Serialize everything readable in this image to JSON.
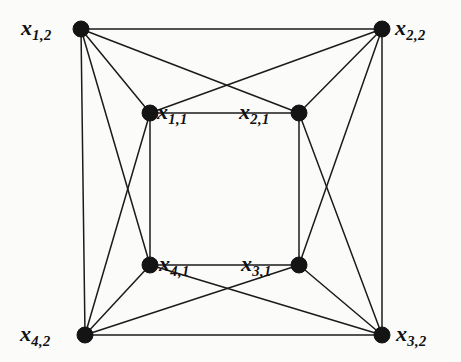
{
  "figure": {
    "kind": "undirected-graph-drawing",
    "title": "",
    "width": 461,
    "height": 362,
    "background_color": "#fbfbfa",
    "node_color": "#141414",
    "edge_color": "#1b1b1b",
    "label_color": "#101010"
  },
  "chart_data": {
    "type": "diagram",
    "title": "",
    "xlabel": "",
    "ylabel": "",
    "nodes": [
      {
        "id": "x12",
        "base": "x",
        "sub": "1,2",
        "label": "x1,2",
        "x": 81,
        "y": 29,
        "radius": 8,
        "label_x": 21,
        "label_y": 17,
        "label_anchor": "left"
      },
      {
        "id": "x22",
        "base": "x",
        "sub": "2,2",
        "label": "x2,2",
        "x": 382,
        "y": 29,
        "radius": 8,
        "label_x": 395,
        "label_y": 17,
        "label_anchor": "right"
      },
      {
        "id": "x11",
        "base": "x",
        "sub": "1,1",
        "label": "x1,1",
        "x": 150,
        "y": 113,
        "radius": 8,
        "label_x": 157,
        "label_y": 101,
        "label_anchor": "right"
      },
      {
        "id": "x21",
        "base": "x",
        "sub": "2,1",
        "label": "x2,1",
        "x": 299,
        "y": 113,
        "radius": 8,
        "label_x": 239,
        "label_y": 101,
        "label_anchor": "left"
      },
      {
        "id": "x41",
        "base": "x",
        "sub": "4,1",
        "label": "x4,1",
        "x": 150,
        "y": 265,
        "radius": 8,
        "label_x": 159,
        "label_y": 253,
        "label_anchor": "right"
      },
      {
        "id": "x31",
        "base": "x",
        "sub": "3,1",
        "label": "x3,1",
        "x": 299,
        "y": 265,
        "radius": 8,
        "label_x": 241,
        "label_y": 253,
        "label_anchor": "left"
      },
      {
        "id": "x42",
        "base": "x",
        "sub": "4,2",
        "label": "x4,2",
        "x": 85,
        "y": 335,
        "radius": 8,
        "label_x": 20,
        "label_y": 323,
        "label_anchor": "left"
      },
      {
        "id": "x32",
        "base": "x",
        "sub": "3,2",
        "label": "x3,2",
        "x": 382,
        "y": 335,
        "radius": 8,
        "label_x": 396,
        "label_y": 323,
        "label_anchor": "right"
      }
    ],
    "edges": [
      {
        "from": "x12",
        "to": "x22",
        "name": "edge-x12-x22"
      },
      {
        "from": "x22",
        "to": "x32",
        "name": "edge-x22-x32"
      },
      {
        "from": "x32",
        "to": "x42",
        "name": "edge-x32-x42"
      },
      {
        "from": "x42",
        "to": "x12",
        "name": "edge-x42-x12"
      },
      {
        "from": "x11",
        "to": "x21",
        "name": "edge-x11-x21"
      },
      {
        "from": "x21",
        "to": "x31",
        "name": "edge-x21-x31"
      },
      {
        "from": "x31",
        "to": "x41",
        "name": "edge-x31-x41"
      },
      {
        "from": "x41",
        "to": "x11",
        "name": "edge-x41-x11"
      },
      {
        "from": "x12",
        "to": "x11",
        "name": "edge-x12-x11"
      },
      {
        "from": "x12",
        "to": "x21",
        "name": "edge-x12-x21"
      },
      {
        "from": "x22",
        "to": "x21",
        "name": "edge-x22-x21"
      },
      {
        "from": "x22",
        "to": "x11",
        "name": "edge-x22-x11"
      },
      {
        "from": "x12",
        "to": "x41",
        "name": "edge-x12-x41"
      },
      {
        "from": "x42",
        "to": "x11",
        "name": "edge-x42-x11"
      },
      {
        "from": "x22",
        "to": "x31",
        "name": "edge-x22-x31"
      },
      {
        "from": "x32",
        "to": "x21",
        "name": "edge-x32-x21"
      },
      {
        "from": "x42",
        "to": "x41",
        "name": "edge-x42-x41"
      },
      {
        "from": "x42",
        "to": "x31",
        "name": "edge-x42-x31"
      },
      {
        "from": "x32",
        "to": "x31",
        "name": "edge-x32-x31"
      },
      {
        "from": "x32",
        "to": "x41",
        "name": "edge-x32-x41"
      }
    ]
  }
}
